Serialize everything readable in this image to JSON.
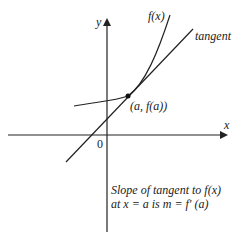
{
  "diagram": {
    "axes": {
      "x_label": "x",
      "y_label": "y",
      "origin_label": "0"
    },
    "curve": {
      "label": "f(x)",
      "color": "#222222"
    },
    "tangent": {
      "label": "tangent",
      "color": "#222222"
    },
    "point": {
      "label": "(a, f(a))"
    },
    "caption": {
      "line1": "Slope of tangent to f(x)",
      "line2": "at x = a is m = f' (a)"
    }
  }
}
